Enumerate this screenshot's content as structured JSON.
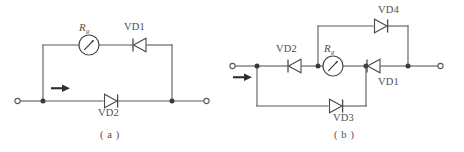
{
  "figure": {
    "type": "electrical-circuit-diagram",
    "line_color": "#5a5a5a",
    "text_color": "#4f4f4f",
    "background": "#ffffff"
  },
  "circuits": [
    {
      "id": "a",
      "caption": "( a )",
      "meter_label": "R",
      "meter_subscript": "g",
      "meter_name": "galvanometer",
      "current_arrow": "input-current-arrow",
      "components": [
        {
          "ref": "VD1",
          "kind": "diode",
          "orientation": "left",
          "branch": "upper"
        },
        {
          "ref": "VD2",
          "kind": "diode",
          "orientation": "right",
          "branch": "lower"
        }
      ],
      "terminals": [
        {
          "side": "left",
          "kind": "open-terminal"
        },
        {
          "side": "right",
          "kind": "open-terminal"
        }
      ]
    },
    {
      "id": "b",
      "caption": "( b )",
      "meter_label": "R",
      "meter_subscript": "g",
      "meter_name": "galvanometer",
      "current_arrow": "input-current-arrow",
      "components": [
        {
          "ref": "VD2",
          "kind": "diode",
          "orientation": "left",
          "branch": "middle-left"
        },
        {
          "ref": "VD1",
          "kind": "diode",
          "orientation": "left",
          "branch": "middle-right"
        },
        {
          "ref": "VD4",
          "kind": "diode",
          "orientation": "right",
          "branch": "upper"
        },
        {
          "ref": "VD3",
          "kind": "diode",
          "orientation": "right",
          "branch": "lower"
        }
      ],
      "terminals": [
        {
          "side": "left",
          "kind": "open-terminal"
        },
        {
          "side": "right",
          "kind": "open-terminal"
        }
      ]
    }
  ],
  "labels": {
    "a_vd1": "VD1",
    "a_vd2": "VD2",
    "a_rg": "R",
    "a_rg_sub": "g",
    "a_caption": "( a )",
    "b_vd1": "VD1",
    "b_vd2": "VD2",
    "b_vd3": "VD3",
    "b_vd4": "VD4",
    "b_rg": "R",
    "b_rg_sub": "g",
    "b_caption": "( b )"
  }
}
